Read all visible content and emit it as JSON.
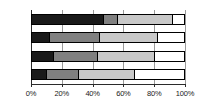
{
  "chart_data": {
    "type": "bar",
    "orientation": "horizontal",
    "stacked": true,
    "normalized": true,
    "title": "",
    "subtitle": "",
    "xlabel": "",
    "ylabel": "",
    "xlim": [
      0,
      100
    ],
    "grid": true,
    "legend": "none",
    "categories": [
      "I (25)",
      "II (38)",
      "III (58)",
      "IV (50)"
    ],
    "xticks": [
      {
        "value": 0,
        "label": "0%"
      },
      {
        "value": 20,
        "label": "20%"
      },
      {
        "value": 40,
        "label": "40%"
      },
      {
        "value": 60,
        "label": "60%"
      },
      {
        "value": 80,
        "label": "80%"
      },
      {
        "value": 100,
        "label": "100%"
      }
    ],
    "series": [
      {
        "name": "segment-1",
        "color": "#1a1a1a",
        "values": [
          47,
          11,
          14,
          9
        ]
      },
      {
        "name": "segment-2",
        "color": "#808080",
        "values": [
          9,
          33,
          29,
          21
        ]
      },
      {
        "name": "segment-3",
        "color": "#c8c8c8",
        "values": [
          36,
          38,
          37,
          37
        ]
      },
      {
        "name": "segment-4",
        "color": "#ffffff",
        "values": [
          8,
          18,
          20,
          33
        ]
      }
    ],
    "rows": [
      {
        "label": "I (25)",
        "segments": [
          47,
          9,
          36,
          8
        ]
      },
      {
        "label": "II (38)",
        "segments": [
          11,
          33,
          38,
          18
        ]
      },
      {
        "label": "III (58)",
        "segments": [
          14,
          29,
          37,
          20
        ]
      },
      {
        "label": "IV (50)",
        "segments": [
          9,
          21,
          37,
          33
        ]
      }
    ]
  },
  "style": {
    "segment_colors": [
      "#1a1a1a",
      "#808080",
      "#c8c8c8",
      "#ffffff"
    ],
    "border_color": "#000000",
    "grid_color": "#9a9a9a",
    "text_color": "#1a1a1a",
    "background": "#ffffff"
  }
}
